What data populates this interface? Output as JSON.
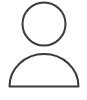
{
  "canvas": {
    "width": 87,
    "height": 100,
    "background_color": "#ffffff"
  },
  "icon": {
    "name": "user-avatar-placeholder-icon",
    "title": "User",
    "description": "Generic person silhouette outline: circular head above a semicircular body",
    "stroke_color": "#3a3a3a",
    "fill_color": "none",
    "stroke_width": 2,
    "parts": {
      "head": {
        "name": "head-circle",
        "shape": "circle",
        "cx": 44,
        "cy": 24,
        "r": 21.5
      },
      "body": {
        "name": "body-semicircle",
        "shape": "semicircle",
        "cx": 44,
        "base_y": 86.5,
        "top_y": 54,
        "left_x": 9.5,
        "right_x": 78.5,
        "rx": 34.5,
        "ry": 32.5,
        "path": "M 9.5 86.5 A 34.5 32.5 0 0 1 78.5 86.5 Z"
      }
    }
  }
}
